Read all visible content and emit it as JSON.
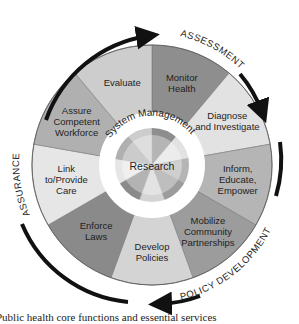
{
  "diagram": {
    "center_label": "Research",
    "ring_label": "System Management",
    "segments": [
      {
        "lines": [
          "Monitor",
          "Health"
        ],
        "shade": "#8e8e8e"
      },
      {
        "lines": [
          "Diagnose",
          "and Investigate"
        ],
        "shade": "#e2e2e2"
      },
      {
        "lines": [
          "Inform,",
          "Educate,",
          "Empower"
        ],
        "shade": "#b5b5b5"
      },
      {
        "lines": [
          "Mobilize",
          "Community",
          "Partnerships"
        ],
        "shade": "#9c9c9c"
      },
      {
        "lines": [
          "Develop",
          "Policies"
        ],
        "shade": "#d4d4d4"
      },
      {
        "lines": [
          "Enforce",
          "Laws"
        ],
        "shade": "#8a8a8a"
      },
      {
        "lines": [
          "Link",
          "to/Provide",
          "Care"
        ],
        "shade": "#e6e6e6"
      },
      {
        "lines": [
          "Assure",
          "Competent",
          "Workforce"
        ],
        "shade": "#b0b0b0"
      },
      {
        "lines": [
          "Evaluate"
        ],
        "shade": "#cdcdcd"
      }
    ],
    "core_functions": [
      {
        "label": "ASSESSMENT"
      },
      {
        "label": "POLICY DEVELOPMENT"
      },
      {
        "label": "ASSURANCE"
      }
    ]
  },
  "caption": "Public health core functions and essential services"
}
